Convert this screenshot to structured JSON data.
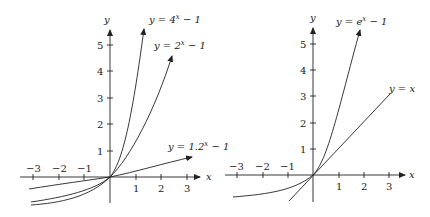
{
  "graphs": [
    {
      "name": "left",
      "x_label": "x",
      "y_label": "y",
      "x_ticks": [
        "−3",
        "−2",
        "−1",
        "1",
        "2",
        "3"
      ],
      "y_ticks": [
        "1",
        "2",
        "3",
        "4",
        "5"
      ],
      "curves": [
        {
          "label": "y = 4ˣ − 1",
          "base": 4
        },
        {
          "label": "y = 2ˣ − 1",
          "base": 2
        },
        {
          "label": "y = 1.2ˣ − 1",
          "base": 1.2
        }
      ]
    },
    {
      "name": "right",
      "x_label": "x",
      "y_label": "y",
      "x_ticks": [
        "−3",
        "−2",
        "−1",
        "1",
        "2",
        "3"
      ],
      "y_ticks": [
        "1",
        "2",
        "3",
        "4",
        "5"
      ],
      "curves": [
        {
          "label": "y = eˣ − 1",
          "base": 2.71828
        },
        {
          "label": "y = x",
          "base": null
        }
      ]
    }
  ],
  "labels": {
    "left_y": "y",
    "left_x": "x",
    "right_y": "y",
    "right_x": "x",
    "eq_4x": "y = 4",
    "eq_4x_sup": "x",
    "eq_4x_tail": " − 1",
    "eq_2x": "y = 2",
    "eq_2x_sup": "x",
    "eq_2x_tail": " − 1",
    "eq_12x": "y = 1.2",
    "eq_12x_sup": "x",
    "eq_12x_tail": " − 1",
    "eq_ex": "y = e",
    "eq_ex_sup": "x",
    "eq_ex_tail": " − 1",
    "eq_yx": "y = x",
    "tick_m3": "−3",
    "tick_m2": "−2",
    "tick_m1": "−1",
    "tick_1": "1",
    "tick_2": "2",
    "tick_3": "3",
    "tick_4": "4",
    "tick_5": "5"
  }
}
